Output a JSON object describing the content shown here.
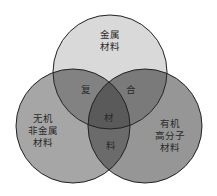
{
  "diagram": {
    "type": "venn-3",
    "circles": [
      {
        "id": "metal",
        "label_lines": [
          "金属",
          "材料"
        ],
        "fill": "#d9d9d9"
      },
      {
        "id": "inorganic",
        "label_lines": [
          "无机",
          "非金属",
          "材料"
        ],
        "fill": "#a6a6a6"
      },
      {
        "id": "organic",
        "label_lines": [
          "有机",
          "高分子",
          "材料"
        ],
        "fill": "#969696"
      }
    ],
    "intersection_labels": {
      "metal_inorganic": "复",
      "metal_organic": "合",
      "all_three": "材",
      "inorganic_organic": "料"
    },
    "intersection_phrase": "复合材料",
    "colors": {
      "stroke": "#222222",
      "metal_inorganic": "#828282",
      "metal_organic": "#7a7a7a",
      "inorganic_organic": "#6b6b6b",
      "center": "#5a5a5a"
    }
  }
}
